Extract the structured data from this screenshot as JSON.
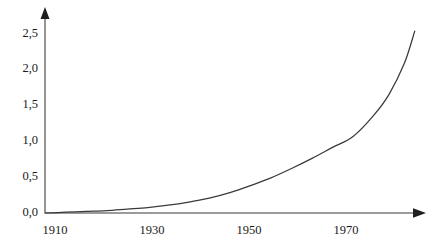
{
  "chart_data": {
    "type": "line",
    "title": "",
    "subtitle": "",
    "xlabel": "",
    "ylabel": "",
    "xlim": [
      1910,
      1984
    ],
    "ylim": [
      0.0,
      2.6
    ],
    "grid": false,
    "legend": null,
    "x_tick_labels": [
      "1910",
      "1930",
      "1950",
      "1970"
    ],
    "x_ticks": [
      1910,
      1930,
      1950,
      1970
    ],
    "y_tick_labels": [
      "0,0",
      "0,5",
      "1,0",
      "1,5",
      "2,0",
      "2,5"
    ],
    "y_ticks": [
      0.0,
      0.5,
      1.0,
      1.5,
      2.0,
      2.5
    ],
    "decimal_separator": ",",
    "series": [
      {
        "name": "",
        "color": "#3a3a3a",
        "x": [
          1910,
          1914,
          1918,
          1922,
          1926,
          1930,
          1934,
          1938,
          1942,
          1946,
          1950,
          1954,
          1958,
          1962,
          1966,
          1970,
          1974,
          1977,
          1980,
          1982
        ],
        "values": [
          0.0,
          0.01,
          0.02,
          0.03,
          0.05,
          0.07,
          0.1,
          0.14,
          0.19,
          0.26,
          0.35,
          0.45,
          0.57,
          0.7,
          0.84,
          0.98,
          1.25,
          1.52,
          1.92,
          2.33
        ]
      }
    ],
    "axis_color": "#7a7a7a",
    "axis_arrow_x": true,
    "axis_arrow_y": true,
    "background": "#ffffff"
  },
  "geometry": {
    "origin_x": 45,
    "origin_y": 213,
    "x_axis_end": 425,
    "y_axis_end": 10,
    "px_per_year": 4.85,
    "px_per_unit": 71.6
  }
}
